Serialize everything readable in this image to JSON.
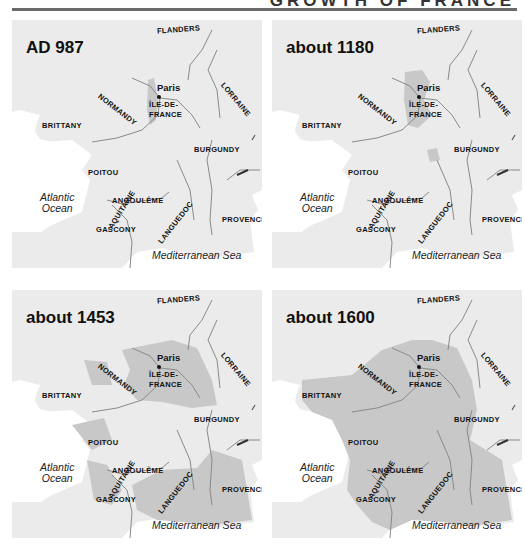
{
  "header": {
    "title": "GROWTH OF FRANCE"
  },
  "colors": {
    "land": "#ebebeb",
    "sea": "#ffffff",
    "royal_domain": "#c8c8c8",
    "river": "#8a8a8a",
    "rule": "#6a6a6a"
  },
  "panels": [
    {
      "title": "AD 987",
      "period": "987"
    },
    {
      "title": "about 1180",
      "period": "1180"
    },
    {
      "title": "about 1453",
      "period": "1453"
    },
    {
      "title": "about 1600",
      "period": "1600"
    }
  ],
  "labels": {
    "flanders": "Flanders",
    "normandy": "Normandy",
    "paris": "Paris",
    "ile_de_france_1": "Île-de-",
    "ile_de_france_2": "France",
    "lorraine": "Lorraine",
    "brittany": "Brittany",
    "burgundy": "Burgundy",
    "poitou": "Poitou",
    "atlantic_1": "Atlantic",
    "atlantic_2": "Ocean",
    "angouleme": "Angoulême",
    "aquitaine": "Aquitaine",
    "gascony": "Gascony",
    "languedoc": "Languedoc",
    "provence": "Provence",
    "mediterranean": "Mediterranean Sea"
  },
  "legend_note": "Shaded areas show the royal domain of France at each date"
}
